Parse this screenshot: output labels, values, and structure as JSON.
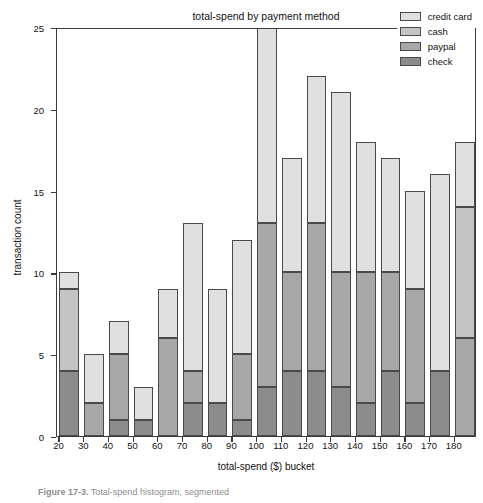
{
  "chart_data": {
    "type": "bar",
    "subtype": "stacked-bar",
    "title": "total-spend by payment method",
    "xlabel": "total-spend ($) bucket",
    "ylabel": "transaction count",
    "categories": [
      "20",
      "30",
      "40",
      "50",
      "60",
      "70",
      "80",
      "90",
      "100",
      "110",
      "120",
      "130",
      "140",
      "150",
      "160",
      "170",
      "180"
    ],
    "xticks": [
      "20",
      "30",
      "40",
      "50",
      "60",
      "70",
      "80",
      "90",
      "100",
      "110",
      "120",
      "130",
      "140",
      "150",
      "160",
      "170",
      "180"
    ],
    "yticks": [
      "0",
      "5",
      "10",
      "15",
      "20",
      "25"
    ],
    "ylim": [
      0,
      25
    ],
    "grid": false,
    "legend_position": "top-right",
    "clipped_bars": [
      "100"
    ],
    "series": [
      {
        "name": "check",
        "color": "#8c8c8c",
        "values": [
          4,
          0,
          1,
          1,
          0,
          2,
          2,
          1,
          3,
          4,
          4,
          3,
          2,
          4,
          2,
          4,
          0
        ]
      },
      {
        "name": "paypal",
        "color": "#a8a8a8",
        "values": [
          0,
          2,
          4,
          0,
          6,
          2,
          0,
          4,
          10,
          6,
          9,
          7,
          8,
          6,
          7,
          0,
          6
        ]
      },
      {
        "name": "cash",
        "color": "#c4c4c4",
        "values": [
          5,
          0,
          0,
          0,
          0,
          0,
          0,
          0,
          0,
          0,
          0,
          0,
          0,
          0,
          0,
          0,
          8
        ]
      },
      {
        "name": "credit card",
        "color": "#e0e0e0",
        "values": [
          1,
          3,
          2,
          2,
          3,
          9,
          7,
          7,
          12,
          7,
          9,
          11,
          8,
          7,
          6,
          12,
          4
        ]
      }
    ],
    "totals": [
      10,
      5,
      7,
      3,
      9,
      13,
      9,
      12,
      25,
      17,
      22,
      21,
      18,
      17,
      15,
      16,
      18
    ]
  },
  "legend": {
    "items": [
      {
        "label": "credit card",
        "color": "#e0e0e0"
      },
      {
        "label": "cash",
        "color": "#c4c4c4"
      },
      {
        "label": "paypal",
        "color": "#a8a8a8"
      },
      {
        "label": "check",
        "color": "#8c8c8c"
      }
    ]
  },
  "caption": {
    "prefix": "Figure 17-3.",
    "text": " Total-spend histogram, segmented"
  },
  "colors": {
    "axis": "#3a3a3a",
    "bar_edge": "#4a4a4a",
    "text": "#111111",
    "background": "#ffffff"
  }
}
